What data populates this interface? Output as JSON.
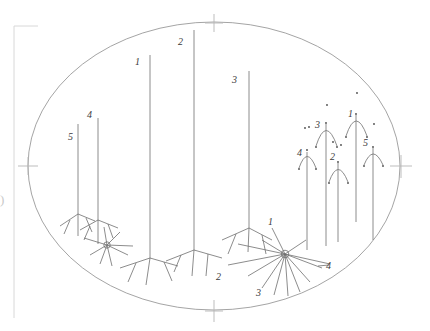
{
  "figure": {
    "background_color": "#ffffff",
    "outline_color": "#9a9a9a",
    "stroke_color": "#6e6e6e",
    "label_color": "#3a3a3a",
    "frame_color": "#d8d8d8",
    "ellipse": {
      "cx": 214,
      "cy": 166,
      "rx": 186,
      "ry": 144,
      "tick_marks": [
        "top",
        "bottom",
        "left",
        "right"
      ]
    },
    "page_artifacts": {
      "left_bracket": "",
      "paren_glyph": ")"
    },
    "clusters": [
      {
        "name": "left-stem-cluster",
        "labels": [
          "5",
          "4"
        ]
      },
      {
        "name": "center-tall-stem-cluster",
        "labels": [
          "1",
          "2",
          "3",
          "2"
        ]
      },
      {
        "name": "starburst-cluster",
        "labels": [
          "1",
          "2",
          "3",
          "4"
        ]
      },
      {
        "name": "right-arc-cluster",
        "labels": [
          "4",
          "3",
          "2",
          "1",
          "5"
        ]
      }
    ],
    "labels": {
      "left_5": "5",
      "left_4": "4",
      "center_1": "1",
      "center_2": "2",
      "center_3": "3",
      "center_bottom_2": "2",
      "burst_1": "1",
      "burst_3": "3",
      "burst_4": "4",
      "arc_4": "4",
      "arc_3": "3",
      "arc_2": "2",
      "arc_1": "1",
      "arc_5": "5"
    }
  }
}
